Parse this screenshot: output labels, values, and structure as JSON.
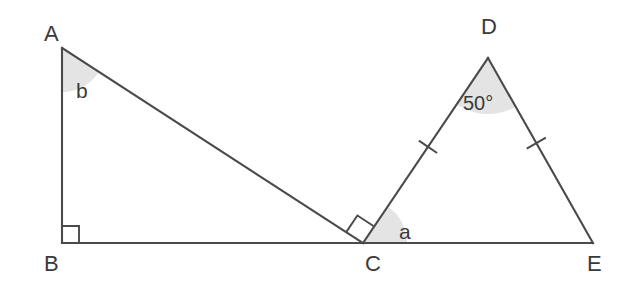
{
  "figure": {
    "background_color": "#ffffff",
    "line_color": "#4a4a4a",
    "angle_fill_color": "#e4e4e4",
    "text_color": "#3a3a3a"
  },
  "vertices": [
    {
      "id": "A",
      "label": "A",
      "x": 62,
      "y": 48,
      "label_x": 44,
      "label_y": 41
    },
    {
      "id": "B",
      "label": "B",
      "x": 62,
      "y": 243,
      "label_x": 44,
      "label_y": 271
    },
    {
      "id": "C",
      "label": "C",
      "x": 363,
      "y": 243,
      "label_x": 365,
      "label_y": 271
    },
    {
      "id": "D",
      "label": "D",
      "x": 488,
      "y": 58,
      "label_x": 481,
      "label_y": 34
    },
    {
      "id": "E",
      "label": "E",
      "x": 593,
      "y": 243,
      "label_x": 587,
      "label_y": 271
    }
  ],
  "segments": [
    {
      "id": "AB",
      "from": "A",
      "to": "B"
    },
    {
      "id": "AC",
      "from": "A",
      "to": "C"
    },
    {
      "id": "BE",
      "from": "B",
      "to": "E"
    },
    {
      "id": "CD",
      "from": "C",
      "to": "D"
    },
    {
      "id": "DE",
      "from": "D",
      "to": "E"
    }
  ],
  "angles": [
    {
      "id": "angle-b",
      "label": "b",
      "at_vertex": "A",
      "between": [
        "AB",
        "AC"
      ],
      "shaded": true,
      "label_x": 76,
      "label_y": 98
    },
    {
      "id": "angle-a",
      "label": "a",
      "at_vertex": "C",
      "between": [
        "CD",
        "CE"
      ],
      "shaded": true,
      "label_x": 399,
      "label_y": 239
    },
    {
      "id": "angle-d",
      "label": "50°",
      "at_vertex": "D",
      "between": [
        "DC",
        "DE"
      ],
      "shaded": true,
      "label_x": 463,
      "label_y": 110
    }
  ],
  "right_angles": [
    {
      "id": "right-angle-b",
      "at_vertex": "B",
      "between": [
        "BA",
        "BE"
      ]
    },
    {
      "id": "right-angle-c",
      "at_vertex": "C",
      "between": [
        "CA",
        "CD"
      ]
    }
  ],
  "tick_marks": [
    {
      "id": "tick-dc",
      "on_segment": "CD",
      "count": 1
    },
    {
      "id": "tick-de",
      "on_segment": "DE",
      "count": 1
    }
  ]
}
